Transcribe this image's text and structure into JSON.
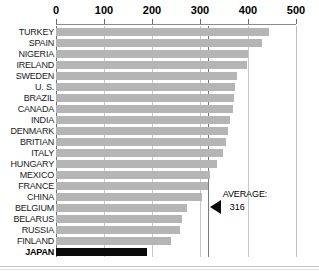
{
  "chart_data": {
    "type": "bar",
    "orientation": "horizontal",
    "title": "",
    "subtitle": "",
    "xlabel": "",
    "ylabel": "",
    "xlim": [
      0,
      500
    ],
    "ylim": null,
    "grid": true,
    "legend_position": "none",
    "xticks": [
      0,
      100,
      200,
      300,
      400,
      500
    ],
    "xtick_labels": [
      "0",
      "100",
      "200",
      "300",
      "400",
      "500"
    ],
    "categories": [
      "TURKEY",
      "SPAIN",
      "NIGERIA",
      "IRELAND",
      "SWEDEN",
      "U. S.",
      "BRAZIL",
      "CANADA",
      "INDIA",
      "DENMARK",
      "BRITIAN",
      "ITALY",
      "HUNGARY",
      "MEXICO",
      "FRANCE",
      "CHINA",
      "BELGIUM",
      "BELARUS",
      "RUSSIA",
      "FINLAND",
      "JAPAN"
    ],
    "values": [
      443,
      430,
      400,
      398,
      378,
      372,
      370,
      368,
      362,
      358,
      355,
      348,
      335,
      320,
      317,
      305,
      272,
      262,
      258,
      240,
      190
    ],
    "highlight_category": "JAPAN",
    "annotations": [
      {
        "label": "AVERAGE:",
        "value": "316",
        "value_numeric": 316,
        "marker": "left-triangle"
      }
    ],
    "colors": {
      "bar": "#b5b5b5",
      "bar_highlight": "#0a0a0a",
      "gridline": "#c9c9c9",
      "axis": "#6d6d6d",
      "average_line": "#7b7b7b",
      "text": "#1a1a1a",
      "background": "#ffffff"
    }
  }
}
